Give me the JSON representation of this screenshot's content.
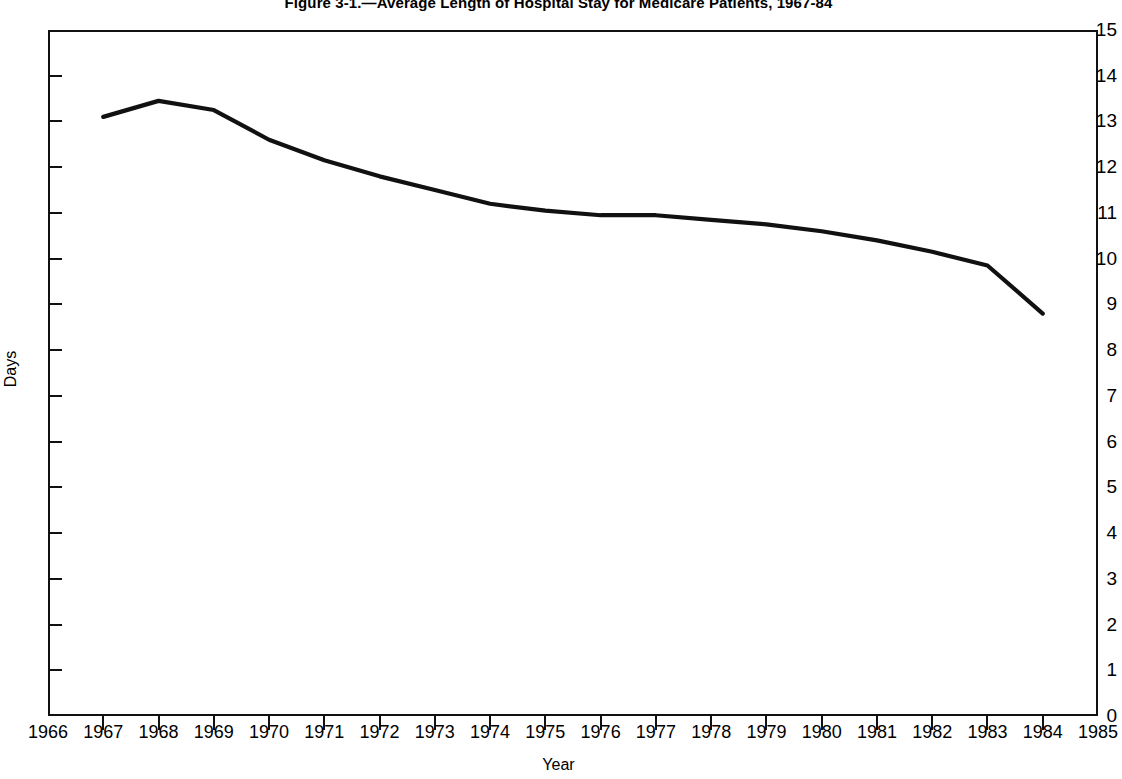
{
  "figure": {
    "title": "Figure 3-1.—Average Length of Hospital Stay for Medicare Patients, 1967-84"
  },
  "axes": {
    "y_title": "Days",
    "x_title": "Year",
    "y_ticks": [
      "15",
      "14",
      "13",
      "12",
      "11",
      "10",
      "9",
      "8",
      "7",
      "6",
      "5",
      "4",
      "3",
      "2",
      "1",
      "0"
    ],
    "x_ticks": [
      "1966",
      "1967",
      "1968",
      "1969",
      "1970",
      "1971",
      "1972",
      "1973",
      "1974",
      "1975",
      "1976",
      "1977",
      "1978",
      "1979",
      "1980",
      "1981",
      "1982",
      "1983",
      "1984",
      "1985"
    ]
  },
  "style": {
    "line_color": "#111111",
    "frame_color": "#111111",
    "background": "#ffffff"
  },
  "chart_data": {
    "type": "line",
    "title": "Figure 3-1.—Average Length of Hospital Stay for Medicare Patients, 1967-84",
    "xlabel": "Year",
    "ylabel": "Days",
    "xlim": [
      1966,
      1985
    ],
    "ylim": [
      0,
      15
    ],
    "grid": false,
    "legend": "none",
    "x": [
      1967,
      1968,
      1969,
      1970,
      1971,
      1972,
      1973,
      1974,
      1975,
      1976,
      1977,
      1978,
      1979,
      1980,
      1981,
      1982,
      1983,
      1984
    ],
    "series": [
      {
        "name": "Average length of stay",
        "values": [
          13.1,
          13.45,
          13.25,
          12.6,
          12.15,
          11.8,
          11.5,
          11.2,
          11.05,
          10.95,
          10.95,
          10.85,
          10.75,
          10.6,
          10.4,
          10.15,
          9.85,
          8.8
        ]
      }
    ]
  }
}
